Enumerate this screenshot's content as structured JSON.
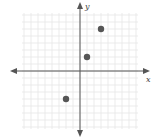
{
  "chart_data": {
    "type": "scatter",
    "title": "",
    "xlabel": "x",
    "ylabel": "y",
    "xlim": [
      -8,
      8
    ],
    "ylim": [
      -8,
      8
    ],
    "grid": true,
    "tick_labels": false,
    "points": [
      {
        "x": 1,
        "y": 2
      },
      {
        "x": 3,
        "y": 6
      },
      {
        "x": -2,
        "y": -4
      }
    ],
    "point_color": "#555555",
    "axis_color": "#555555",
    "grid_color": "#e6e6e6"
  },
  "axes": {
    "x_label": "x",
    "y_label": "y"
  }
}
